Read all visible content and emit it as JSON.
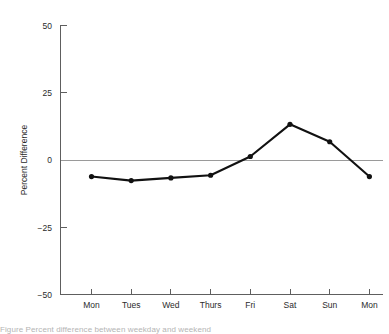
{
  "chart_data": {
    "type": "line",
    "title": "",
    "xlabel": "",
    "ylabel": "Percent Difference",
    "categories": [
      "Mon",
      "Tues",
      "Wed",
      "Thurs",
      "Fri",
      "Sat",
      "Sun",
      "Mon"
    ],
    "values": [
      -12,
      -15,
      -13,
      -11,
      3,
      27,
      14,
      -12
    ],
    "ylim": [
      -50,
      50
    ],
    "yticks": [
      50,
      25,
      0,
      -25,
      -50
    ],
    "ytick_labels": [
      "50",
      "25",
      "0",
      "−25",
      "−50"
    ],
    "grid": false,
    "legend": "none",
    "zero_reference_line": true,
    "marker": "filled-circle",
    "line_color": "#111111",
    "axis_color": "#5e5e5e",
    "zero_line_color": "#9a9a9a"
  },
  "figure": {
    "caption_partial": "Figure  Percent difference between weekday and weekend"
  }
}
